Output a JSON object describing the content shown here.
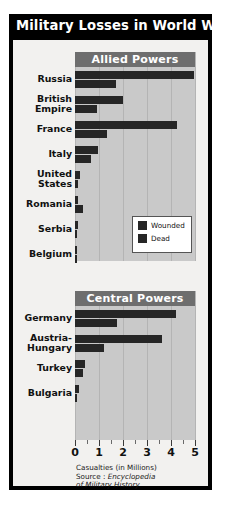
{
  "poster": {
    "title": "Military Losses in World War I",
    "sections": {
      "allied": "Allied Powers",
      "central": "Central Powers"
    },
    "legend": {
      "wounded": "Wounded",
      "dead": "Dead"
    },
    "caption": {
      "line1": "Casualties (in Millions)",
      "source_label": "Source : ",
      "source_title_1": "Encyclopedia",
      "source_title_2": "of Military History"
    },
    "colors": {
      "title_bar": "#000000",
      "panel": "#c9c9c9",
      "band": "#6e6e6e",
      "bar": "#262626",
      "page": "#f2f1ef"
    }
  },
  "chart_data": {
    "type": "bar",
    "orientation": "horizontal",
    "title": "Military Losses in World War I",
    "xlabel": "Casualties (in Millions)",
    "ylabel": "",
    "xlim": [
      0,
      5
    ],
    "xticks": [
      0,
      1,
      2,
      3,
      4,
      5
    ],
    "xticklabels": [
      "0",
      "1",
      "2",
      "3",
      "4",
      "5"
    ],
    "minor_ticks": true,
    "grid": "vertical",
    "legend": [
      "Wounded",
      "Dead"
    ],
    "legend_position": "middle-right",
    "source": "Encyclopedia of Military History",
    "groups": [
      {
        "name": "Allied Powers",
        "categories": [
          "Russia",
          "British Empire",
          "France",
          "Italy",
          "United States",
          "Romania",
          "Serbia",
          "Belgium"
        ],
        "series": [
          {
            "name": "Wounded",
            "values": [
              4.95,
              2.0,
              4.25,
              0.95,
              0.2,
              0.12,
              0.13,
              0.04
            ]
          },
          {
            "name": "Dead",
            "values": [
              1.7,
              0.9,
              1.35,
              0.65,
              0.12,
              0.34,
              0.04,
              0.02
            ]
          }
        ]
      },
      {
        "name": "Central Powers",
        "categories": [
          "Germany",
          "Austria-Hungary",
          "Turkey",
          "Bulgaria"
        ],
        "series": [
          {
            "name": "Wounded",
            "values": [
              4.22,
              3.62,
              0.4,
              0.15
            ]
          },
          {
            "name": "Dead",
            "values": [
              1.77,
              1.2,
              0.32,
              0.09
            ]
          }
        ]
      }
    ]
  }
}
